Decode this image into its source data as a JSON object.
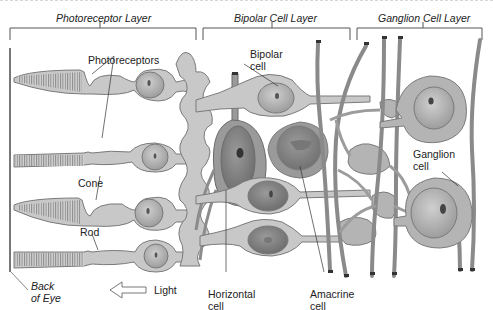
{
  "diagram": {
    "type": "retina-cross-section",
    "layers": [
      {
        "label": "Photoreceptor Layer"
      },
      {
        "label": "Bipolar Cell Layer"
      },
      {
        "label": "Ganglion Cell Layer"
      }
    ],
    "labels": {
      "photoreceptors": "Photoreceptors",
      "cone": "Cone",
      "rod": "Rod",
      "bipolar_1": "Bipolar",
      "bipolar_2": "cell",
      "ganglion_1": "Ganglion",
      "ganglion_2": "cell",
      "horizontal_1": "Horizontal",
      "horizontal_2": "cell",
      "amacrine_1": "Amacrine",
      "amacrine_2": "cell",
      "back_1": "Back",
      "back_2": "of Eye",
      "light": "Light"
    },
    "colors": {
      "cell_fill": "#c8c8c8",
      "cell_stroke": "#7a7a7a",
      "nucleus_fill": "#a9a9a9",
      "dark_cell": "#9a9a9a",
      "bracket": "#555555",
      "text": "#222222"
    }
  }
}
